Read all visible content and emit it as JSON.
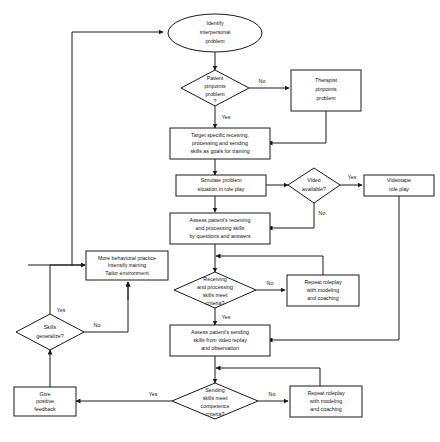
{
  "diagram": {
    "colors": {
      "stroke": "#1a1a1a",
      "background": "#ffffff",
      "text": "#111111"
    },
    "nodes": [
      {
        "id": "identify",
        "shape": "ellipse",
        "lines": [
          "Identify",
          "interpersonal",
          "problem"
        ]
      },
      {
        "id": "patient-pinpoints",
        "shape": "diamond",
        "lines": [
          "Patient",
          "pinpoints",
          "problem",
          "?"
        ]
      },
      {
        "id": "therapist-pinpoints",
        "shape": "rect",
        "lines": [
          "Therapist",
          "pinpoints",
          "problem"
        ]
      },
      {
        "id": "target-skills",
        "shape": "rect",
        "lines": [
          "Target specific receiving,",
          "processing and sending",
          "skills as goals for training"
        ]
      },
      {
        "id": "simulate",
        "shape": "rect",
        "lines": [
          "Simulate problem",
          "situation in role play"
        ]
      },
      {
        "id": "video-available",
        "shape": "diamond",
        "lines": [
          "Video",
          "available?"
        ]
      },
      {
        "id": "videotape",
        "shape": "rect",
        "lines": [
          "Videotape",
          "role play"
        ]
      },
      {
        "id": "assess-receiving",
        "shape": "rect",
        "lines": [
          "Assess patient's receiving",
          "and processing skills",
          "by questions and answers"
        ]
      },
      {
        "id": "more-practice",
        "shape": "rect",
        "lines": [
          "More behavioral practice",
          "Intensify training",
          "Tailor environment"
        ]
      },
      {
        "id": "receiving-criteria",
        "shape": "diamond",
        "lines": [
          "Receiving",
          "and processing",
          "skills meet",
          "criteria?"
        ]
      },
      {
        "id": "repeat-roleplay-1",
        "shape": "rect",
        "lines": [
          "Repeat roleplay",
          "with modeling",
          "and coaching"
        ]
      },
      {
        "id": "assess-sending",
        "shape": "rect",
        "lines": [
          "Assess patient's sending",
          "skills from video replay",
          "and observation"
        ]
      },
      {
        "id": "skills-generalize",
        "shape": "diamond",
        "lines": [
          "Skills",
          "generalize?"
        ]
      },
      {
        "id": "sending-criteria",
        "shape": "diamond",
        "lines": [
          "Sending",
          "skills meet",
          "competence",
          "criteria?"
        ]
      },
      {
        "id": "repeat-roleplay-2",
        "shape": "rect",
        "lines": [
          "Repeat roleplay",
          "with modeling",
          "and coaching"
        ]
      },
      {
        "id": "positive-feedback",
        "shape": "rect",
        "lines": [
          "Give",
          "positive",
          "feedback"
        ]
      }
    ],
    "edge_labels": {
      "patient_no": "No",
      "patient_yes": "Yes",
      "video_yes": "Yes",
      "video_no": "No",
      "receiving_no": "No",
      "receiving_yes": "Yes",
      "generalize_yes": "Yes",
      "generalize_no": "No",
      "sending_no": "No",
      "sending_yes": "Yes"
    }
  }
}
